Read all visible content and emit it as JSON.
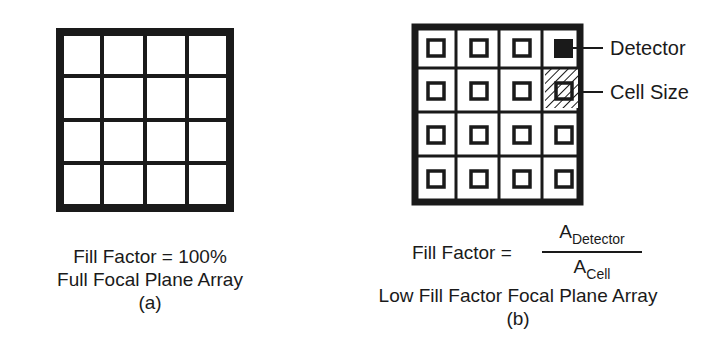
{
  "panel_a": {
    "grid": {
      "rows": 4,
      "cols": 4
    },
    "caption": {
      "line1": "Fill Factor = 100%",
      "line2": "Full Focal Plane Array",
      "line3": "(a)"
    }
  },
  "panel_b": {
    "grid": {
      "rows": 4,
      "cols": 4
    },
    "callouts": {
      "detector": "Detector",
      "cell_size": "Cell Size"
    },
    "formula": {
      "lhs": "Fill Factor =",
      "num_base": "A",
      "num_sub": "Detector",
      "den_base": "A",
      "den_sub": "Cell"
    },
    "caption": {
      "line2": "Low Fill Factor Focal Plane Array",
      "line3": "(b)"
    }
  },
  "colors": {
    "ink": "#1a1a1a",
    "background": "#ffffff"
  }
}
